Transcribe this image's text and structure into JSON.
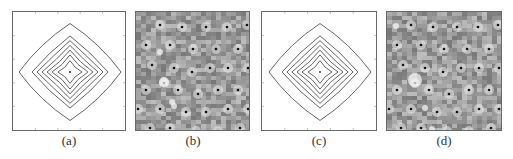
{
  "figure": {
    "panels": [
      {
        "id": "a",
        "caption": "(a)",
        "type": "contour",
        "x": 12,
        "w": 114
      },
      {
        "id": "b",
        "caption": "(b)",
        "type": "intensity-map",
        "x": 135,
        "w": 115
      },
      {
        "id": "c",
        "caption": "(c)",
        "type": "contour",
        "x": 261,
        "w": 116
      },
      {
        "id": "d",
        "caption": "(d)",
        "type": "intensity-map",
        "x": 386,
        "w": 116
      }
    ],
    "contour": {
      "levels": 7,
      "line_color": "#555555",
      "center_dot": true
    },
    "intensity_map": {
      "background": "#9a9a9a",
      "dot_color": "#111111",
      "bright_spot_color": "#f2f2f2"
    }
  }
}
